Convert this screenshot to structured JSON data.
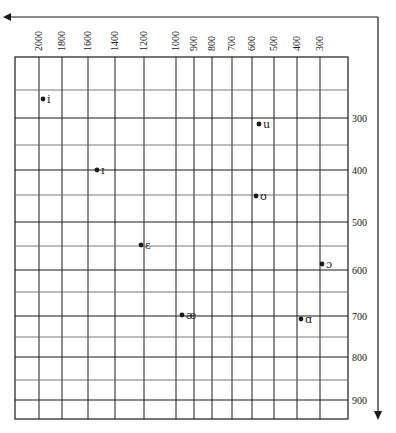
{
  "chart_data": {
    "type": "scatter",
    "title": "",
    "xlabel": "F2 (Hz)",
    "ylabel": "F1 (Hz)",
    "x_axis": {
      "position": "top",
      "direction": "reversed",
      "scale": "log-like",
      "ticks": [
        2000,
        1800,
        1600,
        1400,
        1200,
        1000,
        900,
        800,
        700,
        600,
        500,
        400,
        300
      ],
      "tick_labels": [
        "2000",
        "1800",
        "1600",
        "1400",
        "1200",
        "1000",
        "900",
        "800",
        "700",
        "600",
        "500",
        "400",
        "300"
      ],
      "arrow": "left"
    },
    "y_axis": {
      "position": "right",
      "direction": "downward",
      "ticks": [
        300,
        400,
        500,
        600,
        700,
        800,
        900
      ],
      "tick_labels": [
        "300",
        "400",
        "500",
        "600",
        "700",
        "800",
        "900"
      ],
      "minor_gridlines": [
        250,
        350,
        450,
        550,
        650,
        750,
        850
      ],
      "arrow": "down"
    },
    "grid": true,
    "legend": null,
    "points": [
      {
        "label": "i",
        "F2": 1965,
        "F1": 265
      },
      {
        "label": "ɪ",
        "F2": 1535,
        "F1": 400
      },
      {
        "label": "ɛ",
        "F2": 1220,
        "F1": 550
      },
      {
        "label": "æ",
        "F2": 965,
        "F1": 700
      },
      {
        "label": "u",
        "F2": 570,
        "F1": 310
      },
      {
        "label": "ʊ",
        "F2": 580,
        "F1": 450
      },
      {
        "label": "ɑ",
        "F2": 385,
        "F1": 710
      },
      {
        "label": "ɔ",
        "F2": 290,
        "F1": 590
      }
    ]
  },
  "layout": {
    "plot_left": 15,
    "plot_right": 348,
    "plot_top": 57,
    "plot_bottom": 419,
    "x_pixels": {
      "2000": 39,
      "1800": 62,
      "1600": 88,
      "1400": 115,
      "1200": 144,
      "1000": 176,
      "900": 194,
      "800": 212,
      "700": 232,
      "600": 252,
      "500": 274,
      "400": 297,
      "300": 320
    },
    "y_pixels": {
      "250": 90,
      "300": 118,
      "350": 145,
      "400": 170,
      "450": 195,
      "500": 222,
      "550": 246,
      "600": 270,
      "650": 292,
      "700": 316,
      "750": 337,
      "800": 357,
      "850": 380,
      "900": 400
    },
    "point_pixels": [
      {
        "x": 43,
        "y": 99
      },
      {
        "x": 97,
        "y": 170
      },
      {
        "x": 141,
        "y": 245
      },
      {
        "x": 182,
        "y": 315
      },
      {
        "x": 259,
        "y": 124
      },
      {
        "x": 256,
        "y": 196
      },
      {
        "x": 301,
        "y": 319
      },
      {
        "x": 322,
        "y": 264
      }
    ]
  }
}
